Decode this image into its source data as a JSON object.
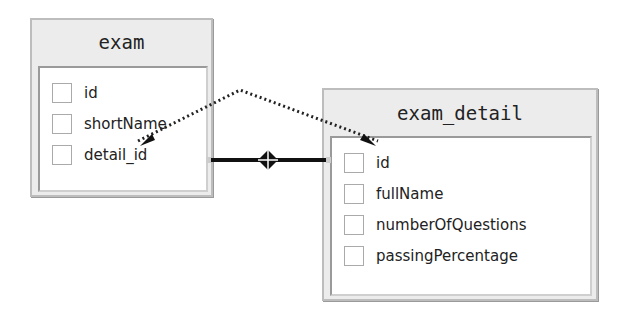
{
  "tables": [
    {
      "name": "exam",
      "columns": [
        "id",
        "shortName",
        "detail_id"
      ]
    },
    {
      "name": "exam_detail",
      "columns": [
        "id",
        "fullName",
        "numberOfQuestions",
        "passingPercentage"
      ]
    }
  ],
  "relationship": {
    "from": "exam.detail_id",
    "to": "exam_detail.id",
    "type": "one-to-one"
  }
}
